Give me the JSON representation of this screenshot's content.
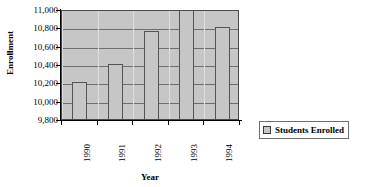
{
  "chart_data": {
    "type": "bar",
    "title": "",
    "xlabel": "Year",
    "ylabel": "Enrollment",
    "categories": [
      "1990",
      "1991",
      "1992",
      "1993",
      "1994"
    ],
    "values": [
      10200,
      10400,
      10760,
      11000,
      10800
    ],
    "series": [
      {
        "name": "Students Enrolled",
        "values": [
          10200,
          10400,
          10760,
          11000,
          10800
        ]
      }
    ],
    "ylim": [
      9800,
      11000
    ],
    "yticks": [
      9800,
      10000,
      10200,
      10400,
      10600,
      10800,
      11000
    ],
    "ytick_labels": [
      "9,800",
      "10,000",
      "10,200",
      "10,400",
      "10,600",
      "10,800",
      "11,000"
    ],
    "grid": true,
    "legend_position": "right",
    "legend_entries": [
      "Students Enrolled"
    ],
    "plot_background_color": "#c6c6c6",
    "bar_fill_color": "#c6c6c6",
    "bar_border_color": "#545454",
    "gridline_color": "#6e6e6e",
    "axis_color": "#000000"
  },
  "legend": {
    "label": "Students Enrolled",
    "swatch_icon": "legend-swatch-icon"
  },
  "axes": {
    "y_title": "Enrollment",
    "x_title": "Year"
  }
}
